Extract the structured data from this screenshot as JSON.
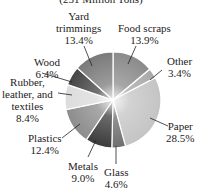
{
  "chart_data": {
    "type": "pie",
    "title": "(251 Million Tons)",
    "start": "top",
    "direction": "clockwise",
    "slices": [
      {
        "name": "Food scraps",
        "value": 13.9,
        "label": "13.9%",
        "color": "#8a8a8a"
      },
      {
        "name": "Other",
        "value": 3.4,
        "label": "3.4%",
        "color": "#a8a8a8"
      },
      {
        "name": "Paper",
        "value": 28.5,
        "label": "28.5%",
        "color": "#c4c4c4"
      },
      {
        "name": "Glass",
        "value": 4.6,
        "label": "4.6%",
        "color": "#6e6e6e"
      },
      {
        "name": "Metals",
        "value": 9.0,
        "label": "9.0%",
        "color": "#3a3a3a"
      },
      {
        "name": "Plastics",
        "value": 12.4,
        "label": "12.4%",
        "color": "#8c8c8c"
      },
      {
        "name": "Rubber, leather, and textiles",
        "value": 8.4,
        "label": "8.4%",
        "color": "#dcdcdc"
      },
      {
        "name": "Wood",
        "value": 6.4,
        "label": "6.4%",
        "color": "#444444"
      },
      {
        "name": "Yard trimmings",
        "value": 13.4,
        "label": "13.4%",
        "color": "#7a7a7a"
      }
    ]
  },
  "labels": {
    "yard": [
      "Yard",
      "trimmings",
      "13.4%"
    ],
    "food": [
      "Food scraps",
      "13.9%"
    ],
    "wood": [
      "Wood",
      "6.4%"
    ],
    "other": [
      "Other",
      "3.4%"
    ],
    "rubber": [
      "Rubber,",
      "leather, and",
      "textiles",
      "8.4%"
    ],
    "paper": [
      "Paper",
      "28.5%"
    ],
    "plastics": [
      "Plastics",
      "12.4%"
    ],
    "metals": [
      "Metals",
      "9.0%"
    ],
    "glass": [
      "Glass",
      "4.6%"
    ]
  }
}
